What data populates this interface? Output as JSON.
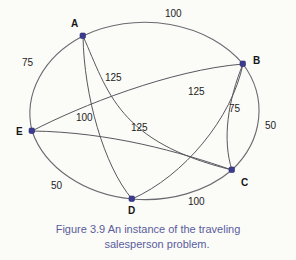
{
  "figure": {
    "caption_line_1": "Figure 3.9  An instance of the traveling",
    "caption_line_2": "salesperson problem.",
    "caption_color": "#5a5d9c",
    "node_color": "#3b3b8f",
    "edge_color": "#58585e",
    "background_color": "#fbfbf8"
  },
  "graph": {
    "type": "complete-weighted-graph",
    "node_count": 5,
    "edge_count": 10,
    "nodes": [
      {
        "id": "A",
        "label": "A",
        "x": 83,
        "y": 36,
        "label_x": 71,
        "label_y": 19
      },
      {
        "id": "B",
        "label": "B",
        "x": 243,
        "y": 64,
        "label_x": 253,
        "label_y": 56
      },
      {
        "id": "C",
        "label": "C",
        "x": 232,
        "y": 170,
        "label_x": 241,
        "label_y": 178
      },
      {
        "id": "D",
        "label": "D",
        "x": 132,
        "y": 199,
        "label_x": 128,
        "label_y": 206
      },
      {
        "id": "E",
        "label": "E",
        "x": 32,
        "y": 131,
        "label_x": 16,
        "label_y": 127
      }
    ],
    "edges": [
      {
        "from": "A",
        "to": "B",
        "weight": "100",
        "label_x": 165,
        "label_y": 9
      },
      {
        "from": "A",
        "to": "E",
        "weight": "75",
        "label_x": 22,
        "label_y": 58
      },
      {
        "from": "A",
        "to": "C",
        "weight": "125",
        "label_x": 105,
        "label_y": 73
      },
      {
        "from": "B",
        "to": "E",
        "weight": "125",
        "label_x": 188,
        "label_y": 87
      },
      {
        "from": "B",
        "to": "C",
        "weight": "75",
        "label_x": 229,
        "label_y": 104
      },
      {
        "from": "B",
        "to": "D",
        "weight": "50",
        "label_x": 265,
        "label_y": 121
      },
      {
        "from": "A",
        "to": "D",
        "weight": "100",
        "label_x": 76,
        "label_y": 113
      },
      {
        "from": "E",
        "to": "C",
        "weight": "125",
        "label_x": 131,
        "label_y": 123
      },
      {
        "from": "E",
        "to": "D",
        "weight": "50",
        "label_x": 51,
        "label_y": 181
      },
      {
        "from": "D",
        "to": "C",
        "weight": "100",
        "label_x": 188,
        "label_y": 197
      }
    ]
  }
}
